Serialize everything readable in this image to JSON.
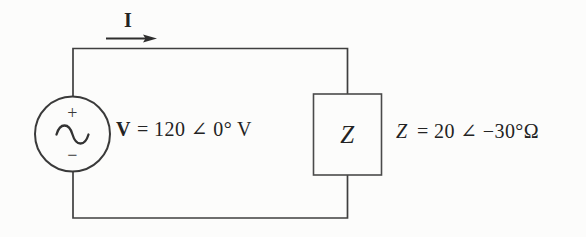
{
  "diagram": {
    "current": {
      "label": "I"
    },
    "source": {
      "plus_sign": "+",
      "minus_sign": "−",
      "voltage_symbol": "V",
      "voltage_value": "= 120 ∠ 0° V"
    },
    "impedance": {
      "box_letter": "Z",
      "impedance_symbol": "Z",
      "impedance_value": "= 20 ∠ −30°Ω"
    },
    "colors": {
      "wire": "#3f3f3f",
      "text": "#232323",
      "background": "#fcfcfb"
    }
  }
}
